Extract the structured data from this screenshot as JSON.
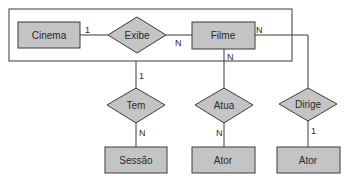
{
  "diagram": {
    "type": "entity-relationship",
    "colors": {
      "shape_fill": "#c4c4c4",
      "stroke": "#3a3a3a",
      "text": "#2a2a2a",
      "background": "#ffffff"
    },
    "entities": {
      "cinema": "Cinema",
      "filme": "Filme",
      "sessao": "Sessão",
      "ator_atua": "Ator",
      "ator_dirige": "Ator"
    },
    "relationships": {
      "exibe": "Exibe",
      "tem": "Tem",
      "atua": "Atua",
      "dirige": "Dirige"
    },
    "cardinalities": {
      "cinema_exibe": "1",
      "exibe_filme": "N",
      "cinema_tem": "1",
      "tem_sessao": "N",
      "filme_atua": "N",
      "atua_ator": "N",
      "filme_dirige": "N",
      "dirige_ator": "1"
    }
  }
}
